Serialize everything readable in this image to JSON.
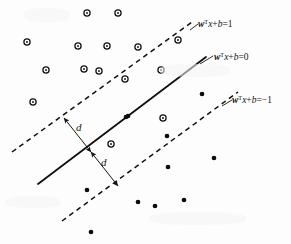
{
  "figure": {
    "background_color": "#fdfdfd",
    "ink_color": "#101010",
    "width": 291,
    "height": 244
  },
  "labels": {
    "upper_boundary": {
      "w": "w",
      "transpose": "T",
      "rest": "x+b=1",
      "full": "wTx+b=1",
      "x": 198,
      "y": 27
    },
    "decision_boundary": {
      "w": "w",
      "transpose": "T",
      "rest": "x+b=0",
      "full": "wTx+b=0",
      "x": 214,
      "y": 60
    },
    "lower_boundary": {
      "w": "w",
      "transpose": "T",
      "rest": "x+b=−1",
      "full": "wTx+b=−1",
      "x": 232,
      "y": 103
    },
    "margin_upper": {
      "text": "d",
      "x": 76,
      "y": 131
    },
    "margin_lower": {
      "text": "d",
      "x": 101,
      "y": 166
    }
  },
  "chart_data": {
    "type": "scatter",
    "xlabel": "",
    "ylabel": "",
    "xlim": [
      0,
      291
    ],
    "ylim": [
      244,
      0
    ],
    "grid": false,
    "legend": "none",
    "annotations": [
      "wTx+b=1",
      "wTx+b=0",
      "wTx+b=−1",
      "d",
      "d"
    ],
    "lines": [
      {
        "name": "upper-margin-boundary",
        "equation": "wTx+b=1",
        "style": "dashed",
        "x1": 12,
        "y1": 152,
        "x2": 192,
        "y2": 22
      },
      {
        "name": "decision-boundary",
        "equation": "wTx+b=0",
        "style": "solid",
        "x1": 38,
        "y1": 184,
        "x2": 206,
        "y2": 57
      },
      {
        "name": "lower-margin-boundary",
        "equation": "wTx+b=-1",
        "style": "dashed",
        "x1": 62,
        "y1": 221,
        "x2": 238,
        "y2": 92
      }
    ],
    "margin_arrows": [
      {
        "name": "margin-arrow-upper",
        "x1": 64,
        "y1": 118,
        "x2": 91,
        "y2": 152,
        "label": "d"
      },
      {
        "name": "margin-arrow-lower",
        "x1": 91,
        "y1": 152,
        "x2": 118,
        "y2": 186,
        "label": "d"
      }
    ],
    "series": [
      {
        "name": "class-positive-open-circles",
        "marker": "open-circle",
        "count": 15,
        "points": [
          [
            27,
            42
          ],
          [
            87,
            13
          ],
          [
            118,
            13
          ],
          [
            78,
            46
          ],
          [
            107,
            46
          ],
          [
            138,
            47
          ],
          [
            46,
            70
          ],
          [
            84,
            69
          ],
          [
            99,
            71
          ],
          [
            33,
            102
          ],
          [
            178,
            40
          ],
          [
            125,
            79
          ],
          [
            161,
            70
          ],
          [
            163,
            118
          ],
          [
            111,
            144
          ]
        ]
      },
      {
        "name": "class-negative-filled-dots",
        "marker": "filled-dot",
        "count": 11,
        "points": [
          [
            128,
            116
          ],
          [
            202,
            94
          ],
          [
            126,
            117
          ],
          [
            167,
            136
          ],
          [
            214,
            158
          ],
          [
            168,
            167
          ],
          [
            87,
            190
          ],
          [
            138,
            202
          ],
          [
            155,
            206
          ],
          [
            184,
            200
          ],
          [
            91,
            232
          ]
        ]
      }
    ]
  }
}
